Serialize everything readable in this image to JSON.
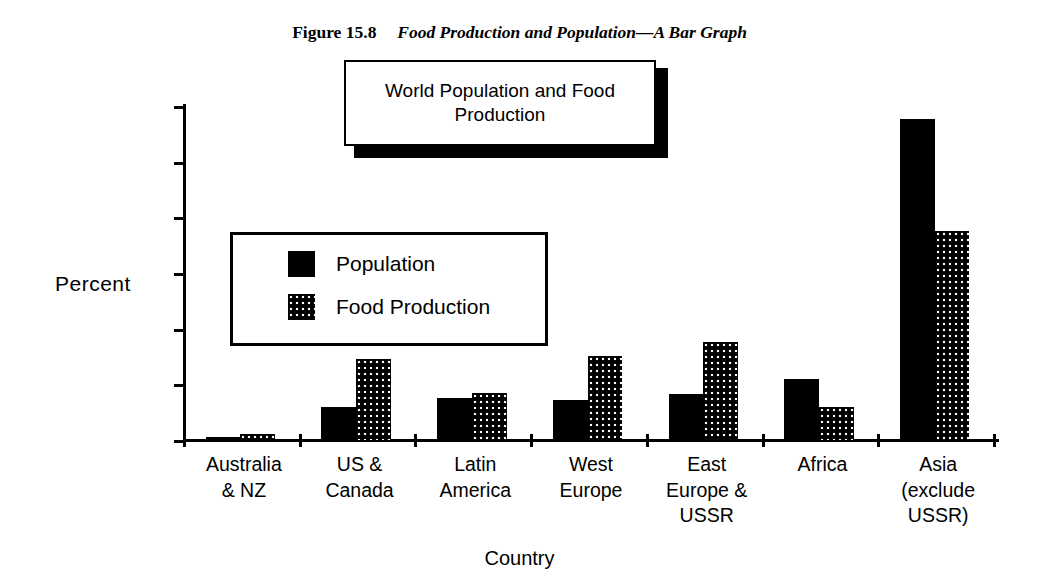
{
  "figure": {
    "label": "Figure 15.8",
    "title": "Food Production and Population—A Bar Graph"
  },
  "chart_title": "World Population and Food Production",
  "legend": {
    "position": "inside-upper-left",
    "entries": [
      {
        "name": "Population",
        "swatch": "solid-black"
      },
      {
        "name": "Food Production",
        "swatch": "dotted-black"
      }
    ]
  },
  "axis": {
    "ylabel": "Percent",
    "xlabel": "Country",
    "yticks": [
      "60",
      "50",
      "40",
      "30",
      "20",
      "10",
      "0"
    ]
  },
  "chart_data": {
    "type": "bar",
    "title": "World Population and Food Production",
    "xlabel": "Country",
    "ylabel": "Percent",
    "ylim": [
      0,
      60
    ],
    "yticks": [
      0,
      10,
      20,
      30,
      40,
      50,
      60
    ],
    "grid": false,
    "legend_position": "inside upper left",
    "categories": [
      "Australia\n& NZ",
      "US &\nCanada",
      "Latin\nAmerica",
      "West\nEurope",
      "East\nEurope &\nUSSR",
      "Africa",
      "Asia\n(exclude\nUSSR)"
    ],
    "series": [
      {
        "name": "Population",
        "fill": "solid-black",
        "values": [
          0.6,
          6.0,
          7.5,
          7.1,
          8.3,
          11.0,
          57.6
        ]
      },
      {
        "name": "Food Production",
        "fill": "dotted-black",
        "values": [
          1.1,
          14.5,
          8.5,
          15.1,
          17.6,
          6.0,
          37.6
        ]
      }
    ]
  }
}
